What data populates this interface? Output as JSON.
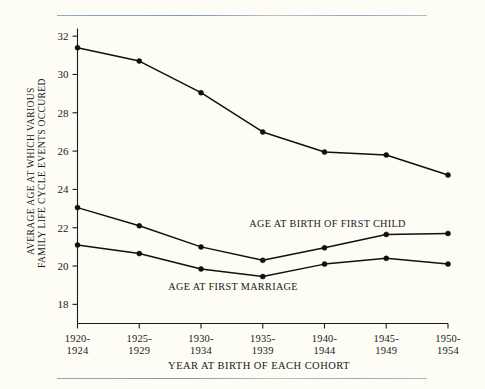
{
  "chart_data": {
    "type": "line",
    "title": "",
    "xlabel": "YEAR AT BIRTH OF EACH COHORT",
    "ylabel_line1": "AVERAGE AGE AT WHICH VARIOUS",
    "ylabel_line2": "FAMILY LIFE CYCLE EVENTS OCCURED",
    "categories": [
      "1920-1924",
      "1925-1929",
      "1930-1934",
      "1935-1939",
      "1940-1944",
      "1945-1949",
      "1950-1954"
    ],
    "category_lines": [
      [
        "1920-",
        "1924"
      ],
      [
        "1925-",
        "1929"
      ],
      [
        "1930-",
        "1934"
      ],
      [
        "1935-",
        "1939"
      ],
      [
        "1940-",
        "1944"
      ],
      [
        "1945-",
        "1949"
      ],
      [
        "1950-",
        "1954"
      ]
    ],
    "ylim": [
      17.0,
      32.4
    ],
    "yticks": [
      32,
      30,
      28,
      26,
      24,
      22,
      20,
      18
    ],
    "ytick_labels": [
      "32",
      "30",
      "28",
      "26",
      "24",
      "22",
      "20",
      "18"
    ],
    "grid": false,
    "legend_position": "inline-annotations",
    "series": [
      {
        "name": "Top unlabeled series",
        "values": [
          31.4,
          30.7,
          29.05,
          27.0,
          25.95,
          25.8,
          24.75
        ]
      },
      {
        "name": "AGE AT BIRTH OF FIRST CHILD",
        "values": [
          23.05,
          22.1,
          21.0,
          20.3,
          20.95,
          21.65,
          21.7
        ]
      },
      {
        "name": "AGE AT FIRST MARRIAGE",
        "values": [
          21.1,
          20.65,
          19.85,
          19.45,
          20.1,
          20.4,
          20.1
        ]
      }
    ],
    "annotations": [
      {
        "text": "AGE AT BIRTH OF FIRST CHILD",
        "x": 4.05,
        "y": 22.05
      },
      {
        "text": "AGE AT FIRST MARRIAGE",
        "x": 2.52,
        "y": 18.75
      }
    ],
    "colors": {
      "line": "#101010",
      "marker": "#101010",
      "background": "#fdfcf5",
      "rule": "#8fa4bd"
    }
  }
}
